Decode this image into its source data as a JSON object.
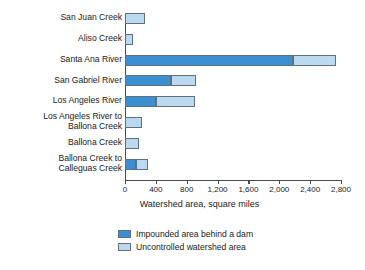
{
  "chart_data": {
    "type": "bar",
    "orientation": "horizontal",
    "stacked": true,
    "title": "",
    "xlabel": "Watershed area, square miles",
    "ylabel": "",
    "xlim": [
      0,
      2900
    ],
    "xticks": [
      0,
      400,
      800,
      1200,
      1600,
      2000,
      2400,
      2800
    ],
    "xtick_labels": [
      "0",
      "400",
      "800",
      "1,200",
      "1,600",
      "2,000",
      "2,400",
      "2,800"
    ],
    "grid": false,
    "legend_position": "bottom",
    "categories": [
      "San Juan Creek",
      "Aliso Creek",
      "Santa Ana River",
      "San Gabriel River",
      "Los Angeles River",
      "Los Angeles River to\nBallona Creek",
      "Ballona Creek",
      "Ballona Creek to\nCalleguas Creek"
    ],
    "series": [
      {
        "name": "Impounded area behind a dam",
        "color": "#3b8ed0",
        "values": [
          0,
          0,
          2180,
          600,
          400,
          0,
          0,
          140
        ]
      },
      {
        "name": "Uncontrolled watershed area",
        "color": "#bad9ee",
        "values": [
          260,
          100,
          560,
          320,
          510,
          220,
          180,
          160
        ]
      }
    ],
    "totals": [
      260,
      100,
      2740,
      920,
      910,
      220,
      180,
      300
    ]
  },
  "axis": {
    "x_title": "Watershed area, square miles"
  },
  "legend": {
    "items": [
      {
        "label": "Impounded area behind a dam",
        "swatch": "dark"
      },
      {
        "label": "Uncontrolled watershed area",
        "swatch": "light"
      }
    ]
  }
}
